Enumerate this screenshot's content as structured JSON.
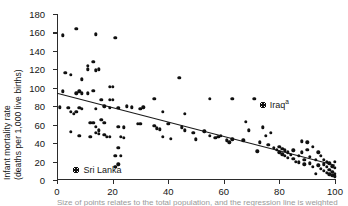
{
  "chart_data": {
    "type": "scatter",
    "title": "",
    "xlabel": "",
    "ylabel": "Infant mortality rate (deaths per 1,000 live births)",
    "ylabel_line1": "Infant mortality rate",
    "ylabel_line2": "(deaths per 1,000 live births)",
    "xlim": [
      0,
      100
    ],
    "ylim": [
      0,
      180
    ],
    "xticks": [
      0,
      20,
      40,
      60,
      80,
      100
    ],
    "yticks": [
      0,
      20,
      40,
      60,
      80,
      100,
      120,
      140,
      160,
      180
    ],
    "grid": false,
    "legend": "none",
    "trendline": {
      "label": "linear fit",
      "x": [
        0,
        100
      ],
      "y": [
        94,
        16
      ]
    },
    "annotations": [
      {
        "label": "Iraq",
        "superscript": "a",
        "x": 74,
        "y": 81,
        "highlight": true
      },
      {
        "label": "Sri Lanka",
        "superscript": "",
        "x": 7,
        "y": 11,
        "highlight": true
      }
    ],
    "points": [
      {
        "x": 2,
        "y": 157
      },
      {
        "x": 7,
        "y": 164
      },
      {
        "x": 14,
        "y": 158
      },
      {
        "x": 21,
        "y": 154
      },
      {
        "x": 5,
        "y": 114
      },
      {
        "x": 11,
        "y": 124
      },
      {
        "x": 11,
        "y": 120
      },
      {
        "x": 13,
        "y": 128
      },
      {
        "x": 14,
        "y": 119
      },
      {
        "x": 15,
        "y": 120
      },
      {
        "x": 9,
        "y": 109
      },
      {
        "x": 13,
        "y": 97
      },
      {
        "x": 19,
        "y": 101
      },
      {
        "x": 20,
        "y": 101
      },
      {
        "x": 44,
        "y": 111
      },
      {
        "x": 2,
        "y": 96
      },
      {
        "x": 7,
        "y": 94
      },
      {
        "x": 9,
        "y": 94
      },
      {
        "x": 11,
        "y": 94
      },
      {
        "x": 16,
        "y": 87
      },
      {
        "x": 19,
        "y": 87
      },
      {
        "x": 20,
        "y": 87
      },
      {
        "x": 55,
        "y": 88
      },
      {
        "x": 63,
        "y": 88
      },
      {
        "x": 1,
        "y": 79
      },
      {
        "x": 4,
        "y": 78
      },
      {
        "x": 5,
        "y": 74
      },
      {
        "x": 6,
        "y": 72
      },
      {
        "x": 7,
        "y": 74
      },
      {
        "x": 8,
        "y": 78
      },
      {
        "x": 9,
        "y": 77
      },
      {
        "x": 14,
        "y": 77
      },
      {
        "x": 17,
        "y": 80
      },
      {
        "x": 19,
        "y": 78
      },
      {
        "x": 22,
        "y": 78
      },
      {
        "x": 25,
        "y": 80
      },
      {
        "x": 27,
        "y": 79
      },
      {
        "x": 30,
        "y": 77
      },
      {
        "x": 31,
        "y": 79
      },
      {
        "x": 35,
        "y": 88
      },
      {
        "x": 38,
        "y": 74
      },
      {
        "x": 5,
        "y": 52
      },
      {
        "x": 8,
        "y": 48
      },
      {
        "x": 12,
        "y": 62
      },
      {
        "x": 13,
        "y": 62
      },
      {
        "x": 14,
        "y": 58
      },
      {
        "x": 14,
        "y": 51
      },
      {
        "x": 15,
        "y": 54
      },
      {
        "x": 15,
        "y": 50
      },
      {
        "x": 16,
        "y": 65
      },
      {
        "x": 17,
        "y": 49
      },
      {
        "x": 18,
        "y": 47
      },
      {
        "x": 19,
        "y": 47
      },
      {
        "x": 22,
        "y": 58
      },
      {
        "x": 24,
        "y": 57
      },
      {
        "x": 29,
        "y": 61
      },
      {
        "x": 30,
        "y": 61
      },
      {
        "x": 36,
        "y": 56
      },
      {
        "x": 37,
        "y": 55
      },
      {
        "x": 38,
        "y": 47
      },
      {
        "x": 40,
        "y": 61
      },
      {
        "x": 41,
        "y": 45
      },
      {
        "x": 45,
        "y": 57
      },
      {
        "x": 46,
        "y": 54
      },
      {
        "x": 49,
        "y": 51
      },
      {
        "x": 50,
        "y": 44
      },
      {
        "x": 53,
        "y": 53
      },
      {
        "x": 55,
        "y": 48
      },
      {
        "x": 57,
        "y": 46
      },
      {
        "x": 58,
        "y": 47
      },
      {
        "x": 59,
        "y": 48
      },
      {
        "x": 61,
        "y": 43
      },
      {
        "x": 62,
        "y": 41
      },
      {
        "x": 63,
        "y": 44
      },
      {
        "x": 67,
        "y": 43
      },
      {
        "x": 68,
        "y": 63
      },
      {
        "x": 69,
        "y": 54
      },
      {
        "x": 71,
        "y": 88
      },
      {
        "x": 72,
        "y": 31
      },
      {
        "x": 73,
        "y": 41
      },
      {
        "x": 74,
        "y": 57
      },
      {
        "x": 75,
        "y": 48
      },
      {
        "x": 76,
        "y": 38
      },
      {
        "x": 77,
        "y": 51
      },
      {
        "x": 78,
        "y": 35
      },
      {
        "x": 79,
        "y": 33
      },
      {
        "x": 80,
        "y": 30
      },
      {
        "x": 80,
        "y": 36
      },
      {
        "x": 81,
        "y": 34
      },
      {
        "x": 81,
        "y": 28
      },
      {
        "x": 82,
        "y": 32
      },
      {
        "x": 82,
        "y": 26
      },
      {
        "x": 83,
        "y": 30
      },
      {
        "x": 83,
        "y": 24
      },
      {
        "x": 84,
        "y": 27
      },
      {
        "x": 85,
        "y": 32
      },
      {
        "x": 85,
        "y": 23
      },
      {
        "x": 86,
        "y": 20
      },
      {
        "x": 87,
        "y": 26
      },
      {
        "x": 87,
        "y": 19
      },
      {
        "x": 88,
        "y": 42
      },
      {
        "x": 88,
        "y": 30
      },
      {
        "x": 89,
        "y": 22
      },
      {
        "x": 89,
        "y": 17
      },
      {
        "x": 90,
        "y": 41
      },
      {
        "x": 90,
        "y": 33
      },
      {
        "x": 91,
        "y": 25
      },
      {
        "x": 91,
        "y": 18
      },
      {
        "x": 92,
        "y": 36
      },
      {
        "x": 92,
        "y": 14
      },
      {
        "x": 93,
        "y": 22
      },
      {
        "x": 94,
        "y": 30
      },
      {
        "x": 94,
        "y": 16
      },
      {
        "x": 95,
        "y": 26
      },
      {
        "x": 95,
        "y": 12
      },
      {
        "x": 96,
        "y": 22
      },
      {
        "x": 96,
        "y": 17
      },
      {
        "x": 96,
        "y": 10
      },
      {
        "x": 97,
        "y": 20
      },
      {
        "x": 97,
        "y": 14
      },
      {
        "x": 97,
        "y": 8
      },
      {
        "x": 98,
        "y": 18
      },
      {
        "x": 98,
        "y": 11
      },
      {
        "x": 98,
        "y": 6
      },
      {
        "x": 99,
        "y": 15
      },
      {
        "x": 99,
        "y": 9
      },
      {
        "x": 99,
        "y": 5
      },
      {
        "x": 100,
        "y": 13
      },
      {
        "x": 100,
        "y": 7
      },
      {
        "x": 100,
        "y": 4
      },
      {
        "x": 100,
        "y": 20
      },
      {
        "x": 93,
        "y": 7
      },
      {
        "x": 21,
        "y": 26
      },
      {
        "x": 23,
        "y": 26
      },
      {
        "x": 22,
        "y": 35
      },
      {
        "x": 22,
        "y": 17
      },
      {
        "x": 21,
        "y": 14
      },
      {
        "x": 35,
        "y": 59
      },
      {
        "x": 46,
        "y": 72
      },
      {
        "x": 23,
        "y": 47
      },
      {
        "x": 24,
        "y": 46
      },
      {
        "x": 12,
        "y": 47
      },
      {
        "x": 17,
        "y": 62
      },
      {
        "x": 8,
        "y": 96
      },
      {
        "x": 3,
        "y": 116
      }
    ],
    "colors": {
      "point": "#101010",
      "axis": "#2b2b2b",
      "trendline": "#1a1a1a",
      "text": "#161616"
    }
  },
  "figure": {
    "caption_cutoff": "Size of points relates to the total population, and the regression line is weighted"
  }
}
